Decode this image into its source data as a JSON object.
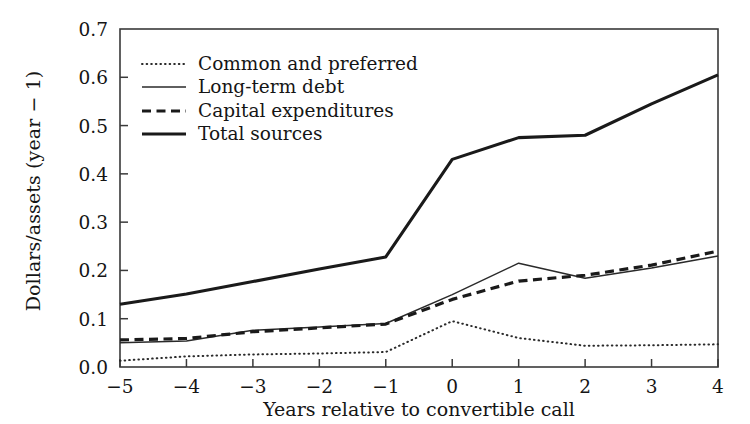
{
  "chart_data": {
    "type": "line",
    "title": "",
    "xlabel": "Years relative to convertible call",
    "ylabel": "Dollars/assets (year − 1)",
    "x": [
      -5,
      -4,
      -3,
      -2,
      -1,
      0,
      1,
      2,
      3,
      4
    ],
    "xtick_labels": [
      "−5",
      "−4",
      "−3",
      "−2",
      "−1",
      "0",
      "1",
      "2",
      "3",
      "4"
    ],
    "ytick_labels": [
      "0.0",
      "0.1",
      "0.2",
      "0.3",
      "0.4",
      "0.5",
      "0.6",
      "0.7"
    ],
    "ylim": [
      0.0,
      0.7
    ],
    "xlim": [
      -5,
      4
    ],
    "grid": false,
    "legend_position": "upper-left",
    "series": [
      {
        "name": "Common and preferred",
        "style": "dotted",
        "color": "#2a2a2a",
        "values": [
          0.013,
          0.022,
          0.026,
          0.028,
          0.031,
          0.095,
          0.06,
          0.044,
          0.045,
          0.047
        ]
      },
      {
        "name": "Long-term debt",
        "style": "solid-thin",
        "color": "#2a2a2a",
        "values": [
          0.05,
          0.054,
          0.076,
          0.083,
          0.09,
          0.15,
          0.215,
          0.184,
          0.205,
          0.23
        ]
      },
      {
        "name": "Capital expenditures",
        "style": "dashed",
        "color": "#1a1a1a",
        "values": [
          0.056,
          0.059,
          0.073,
          0.081,
          0.089,
          0.14,
          0.178,
          0.19,
          0.211,
          0.24
        ]
      },
      {
        "name": "Total sources",
        "style": "solid-thick",
        "color": "#1a1a1a",
        "values": [
          0.13,
          0.151,
          0.177,
          0.203,
          0.228,
          0.43,
          0.475,
          0.48,
          0.545,
          0.605
        ]
      }
    ]
  },
  "legend": {
    "items": [
      {
        "label": "Common and preferred"
      },
      {
        "label": "Long-term debt"
      },
      {
        "label": "Capital expenditures"
      },
      {
        "label": "Total sources"
      }
    ]
  },
  "axes": {
    "y_title": "Dollars/assets (year − 1)",
    "x_title": "Years relative to convertible call"
  }
}
